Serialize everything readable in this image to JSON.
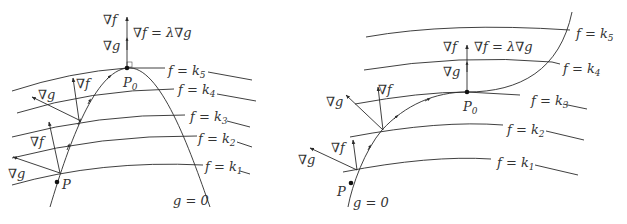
{
  "diagram": {
    "panels": [
      {
        "id": "left",
        "description": "Constraint curve g=0 is a downward parabola tangent to level curve f=k5 at P0",
        "level_curves": [
          "f = k₁",
          "f = k₂",
          "f = k₃",
          "f = k₄",
          "f = k₅"
        ],
        "constraint_label": "g = 0",
        "points": {
          "start": "P",
          "optimum": "P₀"
        },
        "vector_labels": {
          "grad_f": "∇f",
          "grad_g": "∇g"
        },
        "condition": "∇f = λ∇g"
      },
      {
        "id": "right",
        "description": "Constraint curve g=0 rises and is tangent to level curve f=k3 at P0",
        "level_curves": [
          "f = k₁",
          "f = k₂",
          "f = k₃",
          "f = k₄",
          "f = k₅"
        ],
        "constraint_label": "g = 0",
        "points": {
          "start": "P",
          "optimum": "P₀"
        },
        "vector_labels": {
          "grad_f": "∇f",
          "grad_g": "∇g"
        },
        "condition": "∇f = λ∇g"
      }
    ],
    "colors": {
      "stroke": "#2a2a2a",
      "text": "#333333",
      "background": "#ffffff"
    }
  },
  "left": {
    "k1": "f = k",
    "k1_sub": "1",
    "k2": "f = k",
    "k2_sub": "2",
    "k3": "f = k",
    "k3_sub": "3",
    "k4": "f = k",
    "k4_sub": "4",
    "k5": "f = k",
    "k5_sub": "5",
    "g0": "g = 0",
    "P": "P",
    "P0": "P",
    "P0_sub": "0",
    "grad_f": "∇f",
    "grad_g": "∇g",
    "condition": "∇f = λ∇g"
  },
  "right": {
    "k1": "f = k",
    "k1_sub": "1",
    "k2": "f = k",
    "k2_sub": "2",
    "k3": "f = k",
    "k3_sub": "3",
    "k4": "f = k",
    "k4_sub": "4",
    "k5": "f = k",
    "k5_sub": "5",
    "g0": "g = 0",
    "P": "P",
    "P0": "P",
    "P0_sub": "0",
    "grad_f": "∇f",
    "grad_g": "∇g",
    "condition": "∇f = λ∇g"
  }
}
